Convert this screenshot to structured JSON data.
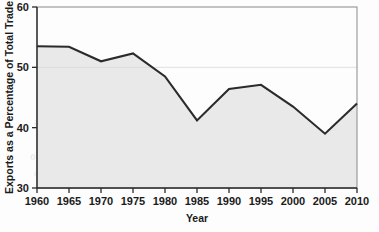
{
  "chart_data": {
    "type": "area",
    "title": "",
    "xlabel": "Year",
    "ylabel": "Exports as a Percentage of Total Trade",
    "categories": [
      1960,
      1965,
      1970,
      1975,
      1980,
      1985,
      1990,
      1995,
      2000,
      2005,
      2010
    ],
    "values": [
      53.5,
      53.4,
      51.0,
      52.3,
      48.5,
      41.2,
      46.4,
      47.1,
      43.5,
      39.0,
      44.0
    ],
    "x_tick_labels": [
      "1960",
      "1965",
      "1970",
      "1975",
      "1980",
      "1985",
      "1990",
      "1995",
      "2000",
      "2005",
      "2010"
    ],
    "y_tick_labels": [
      "30",
      "40",
      "50",
      "60"
    ],
    "y_ticks": [
      30,
      40,
      50,
      60
    ],
    "xlim": [
      1960,
      2010
    ],
    "ylim": [
      30,
      60
    ],
    "grid": "horizontal-at-50",
    "legend": "none",
    "series": [
      {
        "name": "Exports as a Percentage of Total Trade",
        "values": [
          53.5,
          53.4,
          51.0,
          52.3,
          48.5,
          41.2,
          46.4,
          47.1,
          43.5,
          39.0,
          44.0
        ]
      }
    ],
    "line_color": "#2b2b2b",
    "fill_color": "#e8e8e8",
    "background_color": "#fdfdfd"
  },
  "artifacts": {
    "bleed_text": [
      "the economic and political",
      "regions of the world. This book",
      "states and global institutions",
      "and present setting for policies",
      "economies",
      "1940s, 1990s, Contemporary Pol Wo",
      "Stanford Nation Evans World Economies"
    ]
  }
}
